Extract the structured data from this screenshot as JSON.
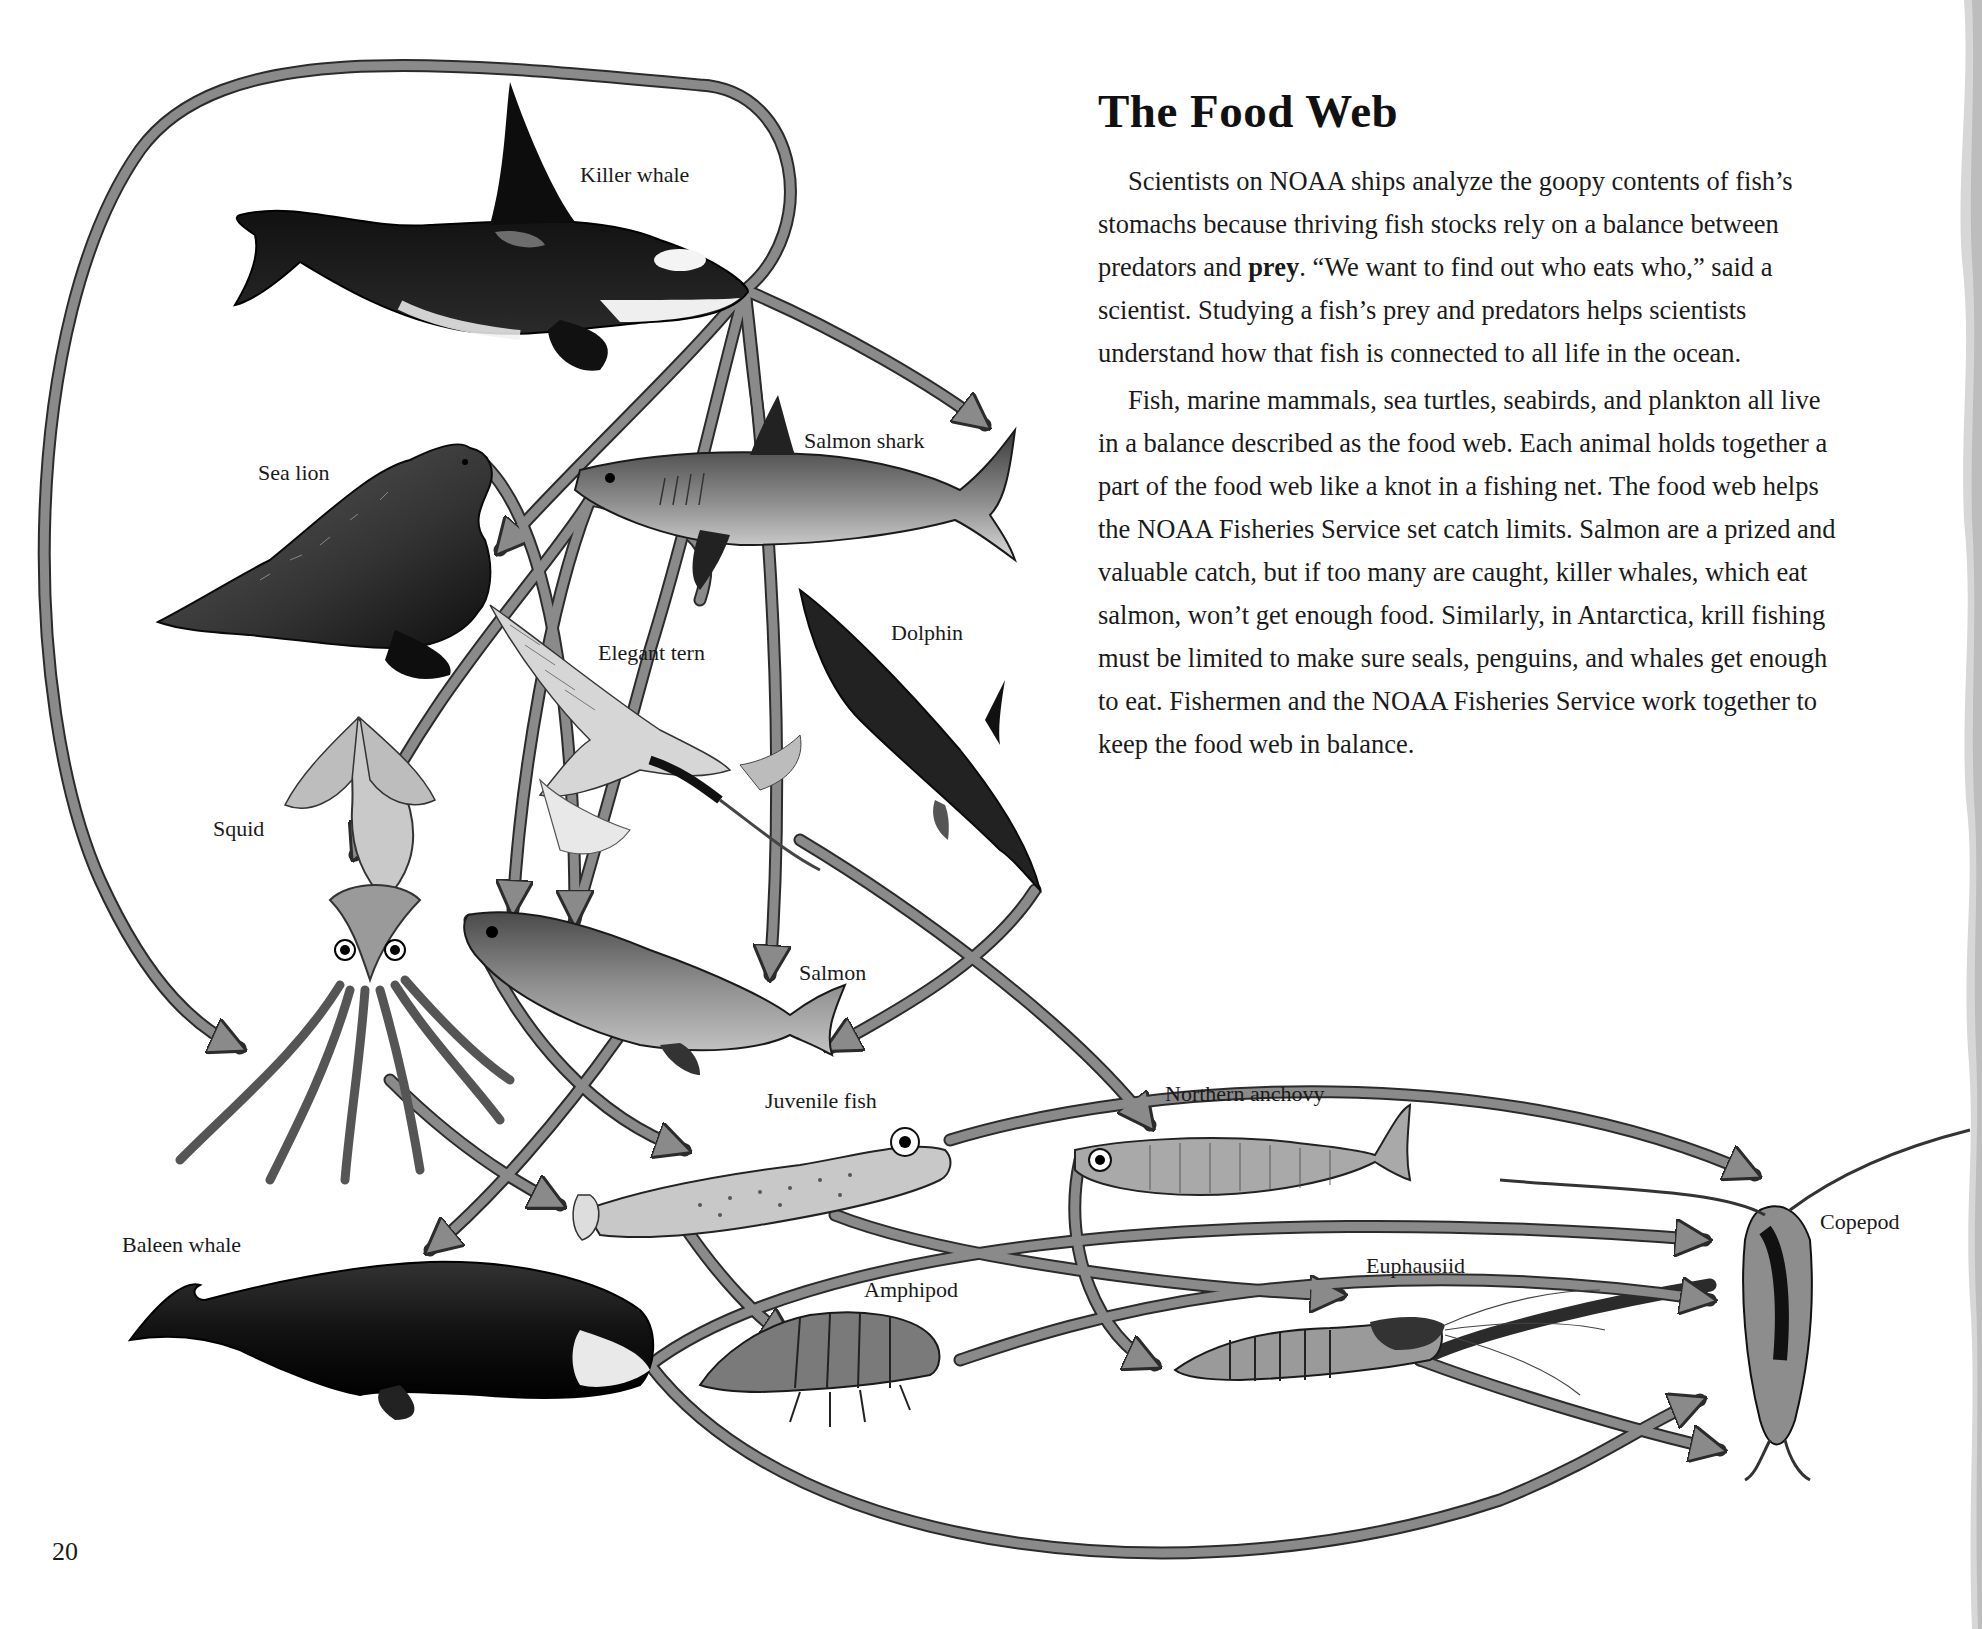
{
  "article": {
    "title": "The Food Web",
    "p1_before": "Scientists on NOAA ships analyze the goopy contents of fish’s stomachs because thriving fish stocks rely on a balance between predators and ",
    "p1_bold": "prey",
    "p1_after": ". “We want to find out who eats who,” said a scientist. Studying a fish’s prey and predators helps scientists understand how that fish is connected to all life in the ocean.",
    "p2": "Fish, marine mammals, sea turtles, seabirds, and plankton all live in a balance described as the food web. Each animal holds together a part of the food web like a knot in a fishing net. The food web helps the NOAA Fisheries Service set catch limits. Salmon are a prized and valuable catch, but if too many are caught, killer whales, which eat salmon, won’t get enough food. Similarly, in Antarctica, krill fishing must be limited to make sure seals, penguins, and whales get enough to eat. Fishermen and the NOAA Fisheries Service work together to keep the food web in balance."
  },
  "page_number": "20",
  "diagram": {
    "labels": {
      "killer_whale": "Killer whale",
      "salmon_shark": "Salmon shark",
      "sea_lion": "Sea lion",
      "dolphin": "Dolphin",
      "elegant_tern": "Elegant tern",
      "squid": "Squid",
      "salmon": "Salmon",
      "juvenile_fish": "Juvenile fish",
      "northern_anchovy": "Northern anchovy",
      "baleen_whale": "Baleen whale",
      "amphipod": "Amphipod",
      "euphausiid": "Euphausiid",
      "copepod": "Copepod"
    },
    "feeding_links": [
      {
        "predator": "Killer whale",
        "prey": "Salmon shark"
      },
      {
        "predator": "Killer whale",
        "prey": "Sea lion"
      },
      {
        "predator": "Killer whale",
        "prey": "Squid"
      },
      {
        "predator": "Killer whale",
        "prey": "Salmon"
      },
      {
        "predator": "Killer whale",
        "prey": "Juvenile fish"
      },
      {
        "predator": "Salmon shark",
        "prey": "Sea lion"
      },
      {
        "predator": "Salmon shark",
        "prey": "Squid"
      },
      {
        "predator": "Salmon shark",
        "prey": "Salmon"
      },
      {
        "predator": "Sea lion",
        "prey": "Salmon"
      },
      {
        "predator": "Dolphin",
        "prey": "Salmon"
      },
      {
        "predator": "Elegant tern",
        "prey": "Northern anchovy"
      },
      {
        "predator": "Salmon",
        "prey": "Juvenile fish"
      },
      {
        "predator": "Salmon",
        "prey": "Baleen whale"
      },
      {
        "predator": "Squid",
        "prey": "Juvenile fish"
      },
      {
        "predator": "Juvenile fish",
        "prey": "Amphipod"
      },
      {
        "predator": "Juvenile fish",
        "prey": "Copepod"
      },
      {
        "predator": "Juvenile fish",
        "prey": "Euphausiid"
      },
      {
        "predator": "Northern anchovy",
        "prey": "Euphausiid"
      },
      {
        "predator": "Baleen whale",
        "prey": "Copepod"
      },
      {
        "predator": "Baleen whale",
        "prey": "Euphausiid"
      },
      {
        "predator": "Amphipod",
        "prey": "Copepod"
      },
      {
        "predator": "Euphausiid",
        "prey": "Copepod"
      }
    ],
    "colors": {
      "arrow_fill": "#8a8a8a",
      "arrow_stroke": "#2b2b2b",
      "animal_dark": "#141414",
      "animal_mid": "#6e6e6e",
      "animal_light": "#d6d6d6"
    }
  }
}
